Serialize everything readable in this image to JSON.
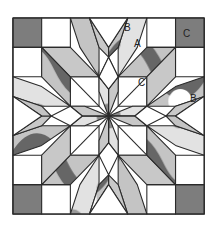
{
  "figure": {
    "labels": [
      {
        "text": "B",
        "note": "top border white triangle"
      },
      {
        "text": "A",
        "note": "diamond piece"
      },
      {
        "text": "C",
        "note": "corner square (dark)"
      },
      {
        "text": "C",
        "note": "white square"
      },
      {
        "text": "B",
        "note": "right border white triangle"
      }
    ]
  },
  "colors": {
    "outline": "#2a2a2a",
    "corner_dark": "#7d7d7d",
    "light_gray": "#c8c8c8",
    "speckled": "#d9d9d9",
    "textured": "#b9b9b9",
    "white": "#ffffff"
  }
}
